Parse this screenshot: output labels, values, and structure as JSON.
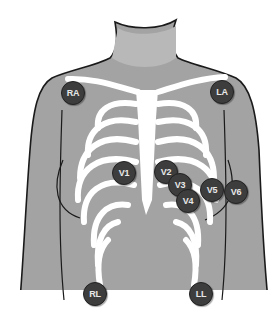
{
  "diagram": {
    "colors": {
      "skin": "#a3a3a3",
      "bone": "#ffffff",
      "outline": "#1a1a1a",
      "electrode_fill": "#3d3d3d",
      "electrode_text": "#e8e8e8"
    },
    "electrodes": [
      {
        "id": "RA",
        "label": "RA",
        "x": 73,
        "y": 93
      },
      {
        "id": "LA",
        "label": "LA",
        "x": 222,
        "y": 92
      },
      {
        "id": "V1",
        "label": "V1",
        "x": 124,
        "y": 173
      },
      {
        "id": "V2",
        "label": "V2",
        "x": 166,
        "y": 172
      },
      {
        "id": "V3",
        "label": "V3",
        "x": 180,
        "y": 185
      },
      {
        "id": "V4",
        "label": "V4",
        "x": 188,
        "y": 201
      },
      {
        "id": "V5",
        "label": "V5",
        "x": 212,
        "y": 190
      },
      {
        "id": "V6",
        "label": "V6",
        "x": 236,
        "y": 192
      },
      {
        "id": "RL",
        "label": "RL",
        "x": 95,
        "y": 294
      },
      {
        "id": "LL",
        "label": "LL",
        "x": 201,
        "y": 294
      }
    ]
  }
}
